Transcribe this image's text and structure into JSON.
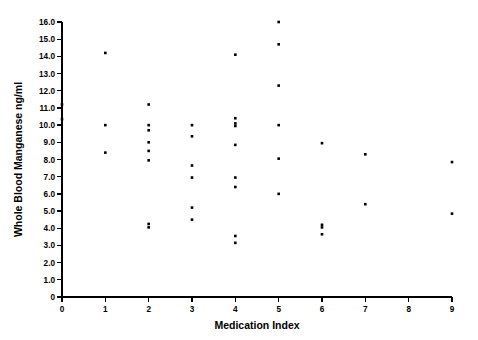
{
  "chart_data": {
    "type": "scatter",
    "title": "",
    "xlabel": "Medication Index",
    "ylabel": "Whole Blood Manganese  ng/ml",
    "xlim": [
      0,
      9
    ],
    "ylim": [
      0,
      16
    ],
    "grid": false,
    "legend": null,
    "x_ticks": [
      "0",
      "1",
      "2",
      "3",
      "4",
      "5",
      "6",
      "7",
      "8",
      "9"
    ],
    "x_tick_values": [
      0,
      1,
      2,
      3,
      4,
      5,
      6,
      7,
      8,
      9
    ],
    "y_ticks": [
      "0",
      "1.0",
      "2.0",
      "3.0",
      "4.0",
      "5.0",
      "6.0",
      "7.0",
      "8.0",
      "9.0",
      "10.0",
      "11.0",
      "12.0",
      "13.0",
      "14.0",
      "15.0",
      "16.0"
    ],
    "y_tick_values": [
      0,
      1,
      2,
      3,
      4,
      5,
      6,
      7,
      8,
      9,
      10,
      11,
      12,
      13,
      14,
      15,
      16
    ],
    "marker": "square",
    "marker_color": "#000000",
    "marker_size": 2.6,
    "points": [
      {
        "x": 0,
        "y": 11.2
      },
      {
        "x": 0,
        "y": 10.35
      },
      {
        "x": 1,
        "y": 14.2
      },
      {
        "x": 1,
        "y": 10.0
      },
      {
        "x": 1,
        "y": 8.4
      },
      {
        "x": 2,
        "y": 11.2
      },
      {
        "x": 2,
        "y": 10.0
      },
      {
        "x": 2,
        "y": 9.7
      },
      {
        "x": 2,
        "y": 9.0
      },
      {
        "x": 2,
        "y": 8.5
      },
      {
        "x": 2,
        "y": 7.95
      },
      {
        "x": 2,
        "y": 4.25
      },
      {
        "x": 2,
        "y": 4.05
      },
      {
        "x": 3,
        "y": 10.0
      },
      {
        "x": 3,
        "y": 9.35
      },
      {
        "x": 3,
        "y": 7.65
      },
      {
        "x": 3,
        "y": 6.95
      },
      {
        "x": 3,
        "y": 5.2
      },
      {
        "x": 3,
        "y": 4.5
      },
      {
        "x": 4,
        "y": 14.1
      },
      {
        "x": 4,
        "y": 10.4
      },
      {
        "x": 4,
        "y": 10.1
      },
      {
        "x": 4,
        "y": 9.95
      },
      {
        "x": 4,
        "y": 8.85
      },
      {
        "x": 4,
        "y": 6.95
      },
      {
        "x": 4,
        "y": 6.4
      },
      {
        "x": 4,
        "y": 3.55
      },
      {
        "x": 4,
        "y": 3.15
      },
      {
        "x": 5,
        "y": 16.0
      },
      {
        "x": 5,
        "y": 14.7
      },
      {
        "x": 5,
        "y": 12.3
      },
      {
        "x": 5,
        "y": 10.0
      },
      {
        "x": 5,
        "y": 8.05
      },
      {
        "x": 5,
        "y": 6.0
      },
      {
        "x": 6,
        "y": 8.95
      },
      {
        "x": 6,
        "y": 4.2
      },
      {
        "x": 6,
        "y": 4.05
      },
      {
        "x": 6,
        "y": 3.65
      },
      {
        "x": 7,
        "y": 8.3
      },
      {
        "x": 7,
        "y": 5.4
      },
      {
        "x": 9,
        "y": 7.85
      },
      {
        "x": 9,
        "y": 4.85
      }
    ]
  },
  "geometry": {
    "plot_left": 62,
    "plot_right": 452,
    "plot_top": 22,
    "plot_bottom": 297
  }
}
